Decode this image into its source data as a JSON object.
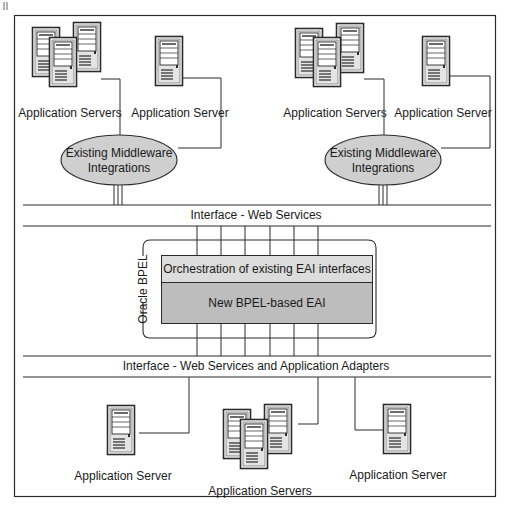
{
  "diagram": {
    "title": "",
    "colors": {
      "line": "#2a2a2a",
      "ellipse_fill": "#cfcfcf",
      "orchestration_fill": "#dcdcdc",
      "bpel_fill": "#bdbdbd",
      "server_fill": "#e6e6e6",
      "server_dark": "#2a2a2a"
    },
    "top_left_group": {
      "cluster_label": "Application Servers",
      "single_label": "Application Server",
      "middleware_line1": "Existing Middleware",
      "middleware_line2": "Integrations"
    },
    "top_right_group": {
      "cluster_label": "Application Servers",
      "single_label": "Application Server",
      "middleware_line1": "Existing Middleware",
      "middleware_line2": "Integrations"
    },
    "interface_top": {
      "label": "Interface - Web Services"
    },
    "bpel": {
      "container_label": "Oracle BPEL",
      "orchestration_label": "Orchestration of existing EAI interfaces",
      "core_label": "New BPEL-based EAI"
    },
    "interface_bottom": {
      "label": "Interface - Web Services and Application Adapters"
    },
    "bottom_group": {
      "left_label": "Application Server",
      "center_label": "Application Servers",
      "right_label": "Application Server"
    },
    "icons": {
      "server": "server-tower-icon",
      "server_cluster": "server-cluster-icon"
    }
  }
}
